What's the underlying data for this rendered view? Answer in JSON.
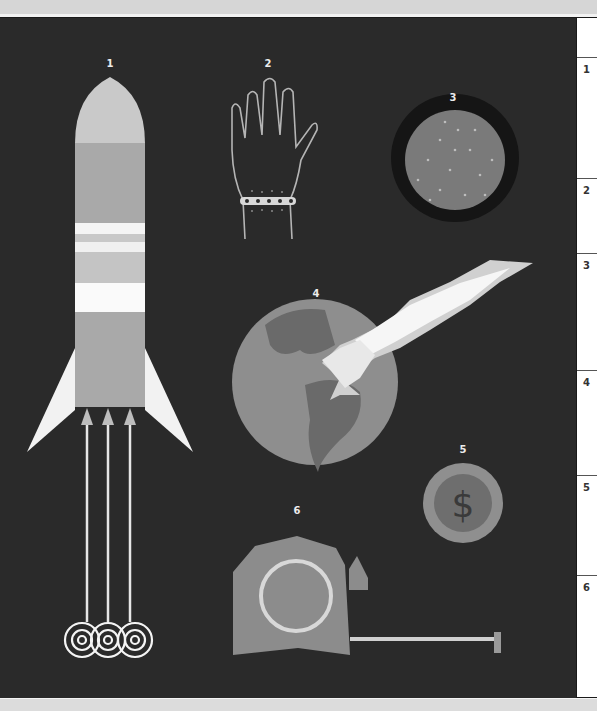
{
  "illustration": {
    "background": "#2a2a2a",
    "items": [
      {
        "number": "1",
        "name": "rocket"
      },
      {
        "number": "2",
        "name": "hand-with-bracelet"
      },
      {
        "number": "3",
        "name": "dotted-disc"
      },
      {
        "number": "4",
        "name": "earth-with-comet-impact"
      },
      {
        "number": "5",
        "name": "dollar-coin"
      },
      {
        "number": "6",
        "name": "tape-measure"
      }
    ]
  },
  "legend": {
    "header": "",
    "rows": [
      {
        "label": "1"
      },
      {
        "label": "2"
      },
      {
        "label": "3"
      },
      {
        "label": "4"
      },
      {
        "label": "5"
      },
      {
        "label": "6"
      }
    ]
  }
}
